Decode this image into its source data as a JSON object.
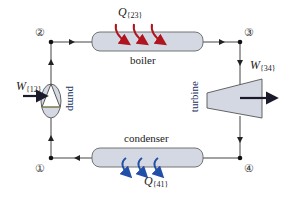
{
  "diagram": {
    "nodes": [
      {
        "id": "1",
        "label": "①"
      },
      {
        "id": "2",
        "label": "②"
      },
      {
        "id": "3",
        "label": "③"
      },
      {
        "id": "4",
        "label": "④"
      }
    ],
    "components": {
      "boiler": {
        "label": "boiler"
      },
      "turbine": {
        "label": "turbine"
      },
      "condenser": {
        "label": "condenser"
      },
      "pump": {
        "label": "pump"
      }
    },
    "energy": {
      "q23": {
        "symbol": "Q",
        "sub": "{23}"
      },
      "q41": {
        "symbol": "Q",
        "sub": "{41}"
      },
      "w12": {
        "symbol": "W",
        "sub": "{12}"
      },
      "w34": {
        "symbol": "W",
        "sub": "{34}"
      }
    },
    "colors": {
      "component_fill": "#d4d8e2",
      "component_stroke": "#555555",
      "heat_in": "#b0141e",
      "heat_out": "#1f4fa8",
      "line": "#333333",
      "work_arrow": "#1a1a2a"
    }
  }
}
